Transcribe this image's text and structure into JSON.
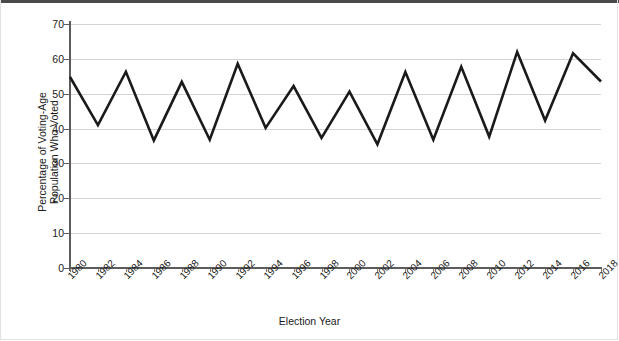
{
  "chart_data": {
    "type": "line",
    "title": "",
    "xlabel": "Election Year",
    "ylabel": "Percentage of Voting-Age Population Who Voted",
    "ylabel_line1": "Percentage of Voting-Age",
    "ylabel_line2": "Population Who Voted",
    "xlim": [
      1980,
      2018
    ],
    "ylim": [
      0,
      70
    ],
    "yticks": [
      0,
      10,
      20,
      30,
      40,
      50,
      60,
      70
    ],
    "ytick_labels": [
      "0",
      "10",
      "20",
      "30",
      "40",
      "50",
      "60",
      "70"
    ],
    "grid": "horizontal",
    "legend": "none",
    "line_color": "#1a1a1a",
    "grid_color": "#d4d4d4",
    "axis_color": "#5c5c5c",
    "background_color": "#ffffff",
    "x": [
      1980,
      1982,
      1984,
      1986,
      1988,
      1990,
      1992,
      1994,
      1996,
      1998,
      2000,
      2002,
      2004,
      2006,
      2008,
      2010,
      2012,
      2014,
      2016,
      2018
    ],
    "categories": [
      "1980",
      "1982",
      "1984",
      "1986",
      "1988",
      "1990",
      "1992",
      "1994",
      "1996",
      "1998",
      "2000",
      "2002",
      "2004",
      "2006",
      "2008",
      "2010",
      "2012",
      "2014",
      "2016",
      "2018"
    ],
    "values": [
      54.8,
      41.0,
      56.3,
      36.6,
      53.4,
      36.8,
      58.6,
      40.2,
      52.2,
      37.3,
      50.6,
      35.5,
      56.2,
      36.8,
      57.7,
      37.7,
      62.0,
      42.3,
      61.6,
      53.5
    ],
    "series": [
      {
        "name": "Voter turnout",
        "values": [
          54.8,
          41.0,
          56.3,
          36.6,
          53.4,
          36.8,
          58.6,
          40.2,
          52.2,
          37.3,
          50.6,
          35.5,
          56.2,
          36.8,
          57.7,
          37.7,
          62.0,
          42.3,
          61.6,
          53.5
        ]
      }
    ]
  }
}
